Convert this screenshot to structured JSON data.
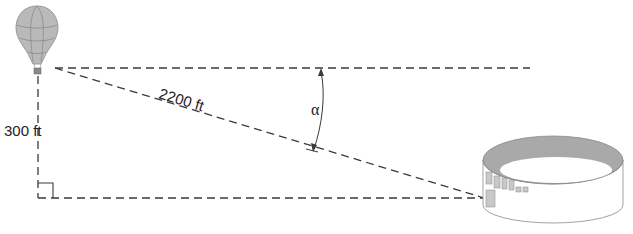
{
  "diagram": {
    "vertical_label": "300 ft",
    "hypotenuse_label": "2200 ft",
    "angle_label": "α",
    "objects": {
      "top": "hot-air-balloon",
      "bottom_right": "stadium"
    },
    "colors": {
      "line": "#3a3a3a",
      "balloon_fill": "#b8b8b8",
      "stadium_inner": "#a8a8a8"
    }
  }
}
